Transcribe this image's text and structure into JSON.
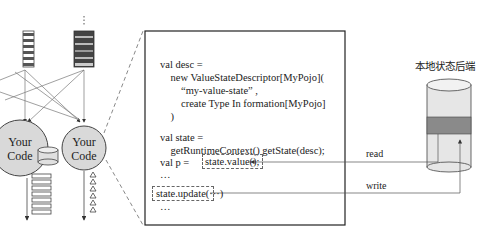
{
  "diagram": {
    "operators": [
      {
        "label_line1": "Your",
        "label_line2": "Code"
      },
      {
        "label_line1": "Your",
        "label_line2": "Code"
      }
    ],
    "code_panel": {
      "lines": [
        "val desc =",
        "    new ValueStateDescriptor[MyPojo](",
        "        “my-value-state” ,",
        "        create Type In formation[MyPojo]",
        "    )",
        "",
        "val state =",
        "    getRuntimeContext() getState(desc);",
        "",
        "val p = ",
        "...",
        "",
        "...",
        ""
      ],
      "value_call": "state.value();",
      "update_call": "state.update(···)",
      "ellipsis": "…"
    },
    "backend": {
      "title": "本地状态后端",
      "read_label": "read",
      "write_label": "write"
    },
    "colors": {
      "node_fill": "#d9d9d9",
      "stripe_dark": "#555555",
      "cylinder_band": "#8a8a8a",
      "cylinder_fill": "#e6e6e6"
    }
  }
}
